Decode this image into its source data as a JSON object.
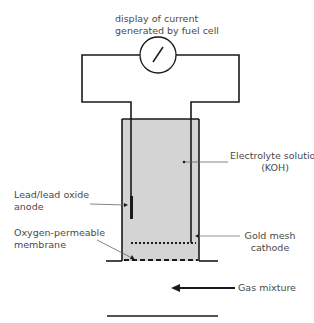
{
  "diagram": {
    "labels": {
      "display_line1": "display of current",
      "display_line2": "generated by fuel cell",
      "electrolyte_line1": "Electrolyte solution",
      "electrolyte_line2": "(KOH)",
      "anode_line1": "Lead/lead oxide",
      "anode_line2": "anode",
      "membrane_line1": "Oxygen-permeable",
      "membrane_line2": "membrane",
      "cathode_line1": "Gold mesh",
      "cathode_line2": "cathode",
      "gas": "Gas mixture"
    },
    "components": [
      {
        "id": "ammeter",
        "label": "display of current generated by fuel cell"
      },
      {
        "id": "electrolyte",
        "label": "Electrolyte solution (KOH)"
      },
      {
        "id": "anode",
        "label": "Lead/lead oxide anode"
      },
      {
        "id": "membrane",
        "label": "Oxygen-permeable membrane"
      },
      {
        "id": "cathode",
        "label": "Gold mesh cathode"
      },
      {
        "id": "gas-flow",
        "label": "Gas mixture"
      }
    ],
    "colors": {
      "line": "#1a1a1a",
      "electrolyte_fill": "#d4d4d4",
      "leader": "#555555",
      "text": "#4a4a4a"
    }
  }
}
